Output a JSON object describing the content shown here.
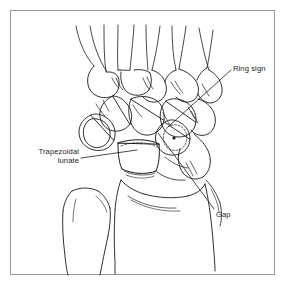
{
  "figure": {
    "type": "medical-line-illustration",
    "frame": {
      "border_color": "#9a9a9a",
      "background_color": "#ffffff"
    },
    "ink_color": "#1a1a1a",
    "annotations": [
      {
        "id": "ring-sign",
        "label": "Ring sign",
        "text_x": 233,
        "text_y": 64,
        "leader_from_x": 231,
        "leader_from_y": 70,
        "leader_to_x": 168,
        "leader_to_y": 127
      },
      {
        "id": "trapezoidal-lunate",
        "label_line_1": "Trapezoidal",
        "label_line_2": "lunate",
        "text_x": 17,
        "text_y": 147,
        "leader_from_x": 81,
        "leader_from_y": 158,
        "leader_to_x": 137,
        "leader_to_y": 150
      },
      {
        "id": "gap",
        "label": "Gap",
        "text_x": 216,
        "text_y": 210,
        "leader_from_x": 214,
        "leader_from_y": 209,
        "leader_to_x": 158,
        "leader_to_y": 133
      }
    ]
  }
}
